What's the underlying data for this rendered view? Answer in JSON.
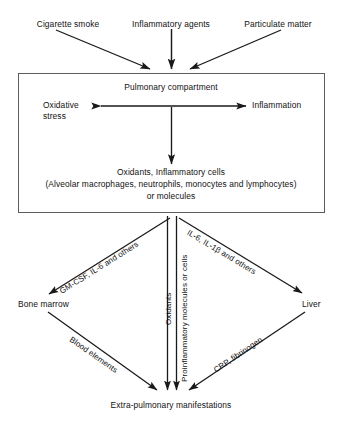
{
  "diagram": {
    "stimuli": [
      {
        "id": "cigarette-smoke",
        "label": "Cigarette smoke"
      },
      {
        "id": "inflammatory-agents",
        "label": "Inflammatory agents"
      },
      {
        "id": "particulate-matter",
        "label": "Particulate matter"
      }
    ],
    "compartment": {
      "title": "Pulmonary compartment",
      "left_node": "Oxidative\nstress",
      "left_node_line1": "Oxidative",
      "left_node_line2": "stress",
      "right_node": "Inflammation",
      "contents_line1": "Oxidants, Inflammatory cells",
      "contents_line2": "(Alveolar macrophages, neutrophils, monocytes and lymphocytes)",
      "contents_line3": "or molecules"
    },
    "mediators": {
      "left": "GM-CSF, IL-6 and others",
      "center_a": "Oxidants",
      "center_b": "Proinflammatory molecules or cells",
      "right": "IL-6, IL-1β  and others"
    },
    "organs": [
      {
        "id": "bone-marrow",
        "label": "Bone marrow"
      },
      {
        "id": "liver",
        "label": "Liver"
      }
    ],
    "effectors": {
      "left": "Blood elements",
      "right": "CRP, fibrinogen"
    },
    "outcome": "Extra-pulmonary manifestations",
    "colors": {
      "stroke": "#1a1a1a",
      "box_border": "#5d5d5d",
      "text": "#111111",
      "background": "#ffffff"
    }
  }
}
